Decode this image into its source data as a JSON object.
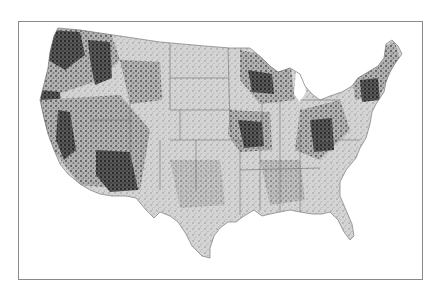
{
  "map": {
    "region": "Contiguous United States",
    "style": "grayscale density map with state boundaries",
    "colors": {
      "background": "#ffffff",
      "land": "#d4d4d4",
      "dense": "#2a2a2a",
      "medium": "#7a7a7a",
      "border": "#8a8a8a",
      "state_lines": "#6e6e6e"
    },
    "dense_areas": [
      "Pacific Northwest",
      "Northern Rockies",
      "Sierra Nevada",
      "Arizona / New Mexico highlands",
      "Ozarks",
      "Upper Great Lakes",
      "Appalachians",
      "New England"
    ]
  }
}
